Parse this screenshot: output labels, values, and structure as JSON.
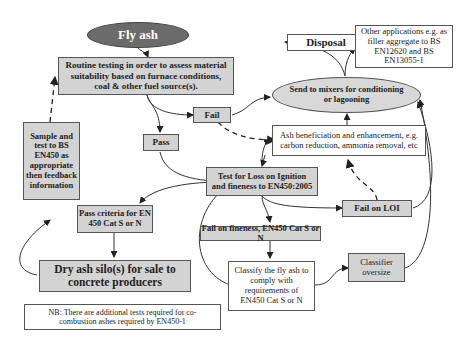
{
  "diagram": {
    "nodes": {
      "fly_ash": "Fly ash",
      "routine": "Routine testing in order to assess material suitability based on furnace conditions, coal & other fuel source(s).",
      "disposal": "Disposal",
      "other_apps": "Other applications e.g. as filler aggregate to BS EN12620 and BS EN13055-1",
      "send_mixers": "Send to mixers for conditioning or lagooning",
      "fail": "Fail",
      "pass": "Pass",
      "ash_benef": "Ash beneficiation and enhancement, e.g. carbon reduction, ammonia removal, etc",
      "sample": "Sample and test to BS EN450 as appropriate then feedback information",
      "test_loi": "Test for Loss on Ignition and fineness to EN450:2005",
      "fail_loi": "Fail on LOI",
      "pass_criteria": "Pass criteria for EN 450 Cat S or N",
      "fail_fineness": "Fail on fineness, EN450 Cat S or N",
      "dry_ash": "Dry ash silo(s) for sale to concrete producers",
      "classify": "Classify the fly ash to comply with requirements of EN450 Cat S or N",
      "classifier": "Classifier oversize",
      "note": "NB: There are additional tests required for co-combustion ashes required by EN450-1"
    },
    "colors": {
      "fly_ash_fill": "#6b6b6b",
      "grey_box": "#d3d3d3",
      "ellipse_fill": "#d8d8d8"
    }
  }
}
